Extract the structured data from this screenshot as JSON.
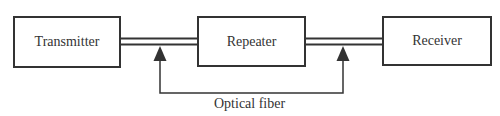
{
  "diagram": {
    "type": "block-diagram",
    "nodes": [
      {
        "id": "transmitter",
        "label": "Transmitter"
      },
      {
        "id": "repeater",
        "label": "Repeater"
      },
      {
        "id": "receiver",
        "label": "Receiver"
      }
    ],
    "edges": [
      {
        "from": "transmitter",
        "to": "repeater",
        "style": "double-line"
      },
      {
        "from": "repeater",
        "to": "receiver",
        "style": "double-line"
      }
    ],
    "annotation": {
      "label": "Optical fiber",
      "points_to": [
        "transmitter-repeater link",
        "repeater-receiver link"
      ]
    },
    "colors": {
      "stroke": "#333333",
      "background": "#ffffff"
    }
  }
}
